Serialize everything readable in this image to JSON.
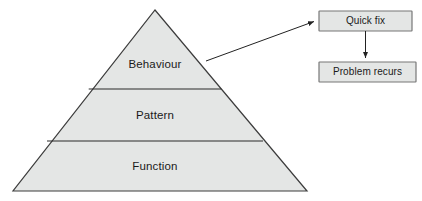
{
  "diagram": {
    "type": "pyramid-with-flow",
    "colors": {
      "pyramid_fill": "#e4e6e5",
      "pyramid_stroke": "#3c3c3c",
      "divider_stroke": "#2b2b2b",
      "box_fill": "#e4e6e5",
      "box_stroke": "#777777",
      "arrow_stroke": "#222222",
      "text": "#1a1a1a",
      "background": "#ffffff"
    },
    "pyramid": {
      "name": "three-tier-pyramid",
      "apex": {
        "x": 155,
        "y": 10
      },
      "base_left": {
        "x": 13,
        "y": 191
      },
      "base_right": {
        "x": 307,
        "y": 191
      },
      "dividers_y": [
        89,
        141
      ],
      "tiers": [
        {
          "id": "behaviour",
          "label": "Behaviour",
          "label_x": 155,
          "label_y": 65,
          "order": 1
        },
        {
          "id": "pattern",
          "label": "Pattern",
          "label_x": 155,
          "label_y": 116,
          "order": 2
        },
        {
          "id": "function",
          "label": "Function",
          "label_x": 155,
          "label_y": 167,
          "order": 3
        }
      ]
    },
    "boxes": [
      {
        "id": "quick-fix",
        "label": "Quick fix",
        "x": 319,
        "y": 11,
        "width": 93,
        "height": 20
      },
      {
        "id": "problem-recurs",
        "label": "Problem recurs",
        "x": 319,
        "y": 62,
        "width": 97,
        "height": 20
      }
    ],
    "arrows": [
      {
        "id": "behaviour-to-quick-fix",
        "from": "behaviour-tier",
        "to": "quick-fix-box",
        "start": {
          "x": 206,
          "y": 61
        },
        "end": {
          "x": 317,
          "y": 21
        }
      },
      {
        "id": "quick-fix-to-problem-recurs",
        "from": "quick-fix-box",
        "to": "problem-recurs-box",
        "start": {
          "x": 366,
          "y": 31
        },
        "end": {
          "x": 366,
          "y": 60
        }
      }
    ]
  }
}
